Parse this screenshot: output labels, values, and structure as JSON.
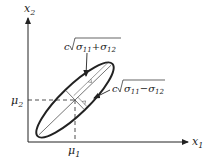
{
  "diagram": {
    "type": "bivariate-normal-ellipse",
    "axes": {
      "x_label": "x",
      "x_sub": "1",
      "y_label": "x",
      "y_sub": "2"
    },
    "center": {
      "mu1_label": "μ",
      "mu1_sub": "1",
      "mu2_label": "μ",
      "mu2_sub": "2"
    },
    "annotations": {
      "major": {
        "c": "c",
        "expr": "σ11+σ12",
        "sigma_a": "σ",
        "sub_a": "11",
        "op": "+",
        "sigma_b": "σ",
        "sub_b": "12"
      },
      "minor": {
        "c": "c",
        "expr": "σ11−σ12",
        "sigma_a": "σ",
        "sub_a": "11",
        "op": "−",
        "sigma_b": "σ",
        "sub_b": "12"
      }
    },
    "colors": {
      "stroke": "#222222",
      "background": "#ffffff"
    }
  }
}
